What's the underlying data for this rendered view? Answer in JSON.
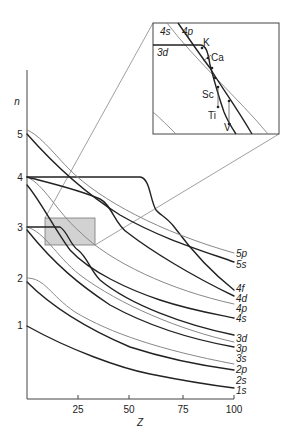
{
  "chart_data": {
    "type": "line",
    "title": "",
    "xlabel": "Z",
    "ylabel": "n",
    "xlim": [
      0,
      100
    ],
    "ylim": [
      0,
      5.5
    ],
    "xticks": [
      "25",
      "50",
      "75",
      "100"
    ],
    "yticks": [
      "1",
      "2",
      "3",
      "4",
      "5"
    ],
    "grid": false,
    "legend_position": "right-end labels",
    "series": [
      {
        "name": "1s",
        "x": [
          0,
          25,
          50,
          75,
          100
        ],
        "values": [
          1.0,
          0.72,
          0.55,
          0.45,
          0.38
        ]
      },
      {
        "name": "2s",
        "x": [
          0,
          25,
          50,
          75,
          100
        ],
        "values": [
          1.9,
          1.4,
          1.05,
          0.82,
          0.66
        ]
      },
      {
        "name": "2p",
        "x": [
          0,
          25,
          50,
          75,
          100
        ],
        "values": [
          2.0,
          1.55,
          1.15,
          0.9,
          0.72
        ]
      },
      {
        "name": "3s",
        "x": [
          0,
          25,
          50,
          75,
          100
        ],
        "values": [
          2.9,
          2.3,
          1.75,
          1.35,
          1.08
        ]
      },
      {
        "name": "3p",
        "x": [
          0,
          25,
          50,
          75,
          100
        ],
        "values": [
          3.0,
          2.45,
          1.85,
          1.45,
          1.18
        ]
      },
      {
        "name": "3d",
        "x": [
          0,
          15,
          25,
          50,
          75,
          100
        ],
        "values": [
          3.0,
          3.0,
          2.6,
          2.0,
          1.6,
          1.3
        ]
      },
      {
        "name": "4s",
        "x": [
          0,
          25,
          50,
          75,
          100
        ],
        "values": [
          3.8,
          2.9,
          2.45,
          2.05,
          1.7
        ]
      },
      {
        "name": "4p",
        "x": [
          0,
          25,
          50,
          75,
          100
        ],
        "values": [
          4.0,
          3.1,
          2.6,
          2.15,
          1.82
        ]
      },
      {
        "name": "4d",
        "x": [
          0,
          25,
          40,
          50,
          75,
          100
        ],
        "values": [
          4.0,
          3.6,
          3.45,
          3.0,
          2.35,
          1.95
        ]
      },
      {
        "name": "4f",
        "x": [
          0,
          40,
          55,
          60,
          75,
          100
        ],
        "values": [
          4.0,
          4.0,
          3.85,
          3.45,
          3.05,
          2.05
        ]
      },
      {
        "name": "5s",
        "x": [
          0,
          25,
          50,
          75,
          100
        ],
        "values": [
          4.9,
          3.95,
          3.3,
          2.85,
          2.4
        ]
      },
      {
        "name": "5p",
        "x": [
          0,
          25,
          50,
          75,
          100
        ],
        "values": [
          5.0,
          4.05,
          3.4,
          2.95,
          2.5
        ]
      }
    ],
    "annotations": [
      "inset zoom of Z≈10–35, n≈2.6–3.2 region",
      "K",
      "Ca",
      "Sc",
      "Ti",
      "V",
      "3d",
      "4s",
      "4p"
    ]
  },
  "axis": {
    "y_title": "n",
    "x_title": "Z",
    "y_ticks": [
      "1",
      "2",
      "3",
      "4",
      "5"
    ],
    "x_ticks": [
      "25",
      "50",
      "75",
      "100"
    ]
  },
  "end_labels": {
    "l5p": "5p",
    "l5s": "5s",
    "l4f": "4f",
    "l4d": "4d",
    "l4p": "4p",
    "l4s": "4s",
    "l3d": "3d",
    "l3p": "3p",
    "l3s": "3s",
    "l2p": "2p",
    "l2s": "2s",
    "l1s": "1s"
  },
  "inset": {
    "curve_4s": "4s",
    "curve_4p": "4p",
    "curve_3d": "3d",
    "elements": {
      "k": "K",
      "ca": "Ca",
      "sc": "Sc",
      "ti": "Ti",
      "v": "V"
    }
  }
}
